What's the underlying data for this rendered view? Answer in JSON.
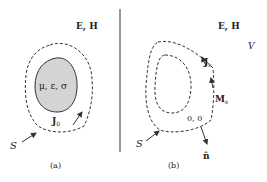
{
  "panel_a": {
    "field_label": "E, H",
    "material_label": "μ, ε, σ",
    "source_label": "J",
    "source_sub": "0",
    "surface_label": "S",
    "caption": "(a)"
  },
  "panel_b": {
    "field_label": "E, H",
    "volume_label": "V",
    "electric_current_label": "J",
    "electric_current_sub": "s",
    "magnetic_current_label": "M",
    "magnetic_current_sub": "s",
    "zero_fields_label": "0, 0",
    "normal_label": "n̂",
    "surface_label": "S",
    "caption": "(b)"
  },
  "colors": {
    "line": "#333333",
    "fill_body": "#d4d4d4",
    "divider": "#555555"
  }
}
